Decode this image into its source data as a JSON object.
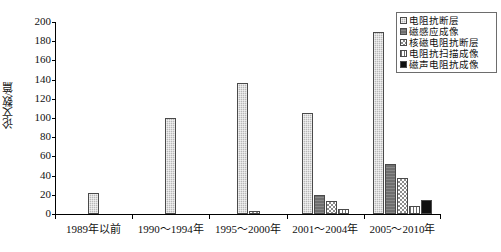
{
  "chart_data": {
    "type": "bar",
    "title": "",
    "xlabel": "",
    "ylabel": "论文数/篇",
    "ylim": [
      0,
      200
    ],
    "yticks": [
      0,
      20,
      40,
      60,
      80,
      100,
      120,
      140,
      160,
      180,
      200
    ],
    "grid": false,
    "legend_position": "top-right",
    "categories": [
      "1989年以前",
      "1990～1994年",
      "1995～2000年",
      "2001～2004年",
      "2005～2010年"
    ],
    "series": [
      {
        "name": "电阻抗断层",
        "pattern": "dot-gray",
        "color": "#b9b9b9",
        "values": [
          22,
          100,
          136,
          105,
          190
        ]
      },
      {
        "name": "磁感应成像",
        "pattern": "dark-gray",
        "color": "#6f6f6f",
        "values": [
          0,
          0,
          0,
          20,
          52
        ]
      },
      {
        "name": "核磁电阻抗断层",
        "pattern": "checkerboard",
        "color": "#8c8c8c",
        "values": [
          0,
          0,
          3,
          14,
          38
        ]
      },
      {
        "name": "电阻抗扫描成像",
        "pattern": "vertical-stripe",
        "color": "#6b6b6b",
        "values": [
          0,
          0,
          0,
          5,
          8
        ]
      },
      {
        "name": "磁声电阻抗成像",
        "pattern": "solid-black",
        "color": "#111111",
        "values": [
          0,
          0,
          0,
          0,
          15
        ]
      }
    ]
  }
}
